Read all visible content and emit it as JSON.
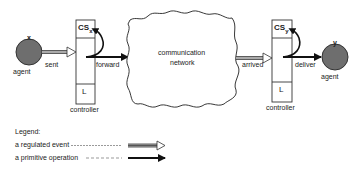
{
  "diagram": {
    "agent_left": {
      "name": "x",
      "label": "agent"
    },
    "agent_right": {
      "name": "y",
      "label": "agent"
    },
    "controller_left": {
      "top_label": "CS",
      "top_sub": "x",
      "bottom_label": "L",
      "caption": "controller"
    },
    "controller_right": {
      "top_label": "CS",
      "top_sub": "y",
      "bottom_label": "L",
      "caption": "controller"
    },
    "network": {
      "line1": "communication",
      "line2": "network"
    },
    "edges": {
      "sent": "sent",
      "forward": "forward",
      "arrived": "arrived",
      "deliver": "deliver"
    },
    "colors": {
      "agent_fill": "#6e6e6e",
      "stroke": "#222222"
    }
  },
  "legend": {
    "title": "Legend:",
    "items": [
      {
        "label": "a regulated event",
        "arrow": "hollow-double-arrow"
      },
      {
        "label": "a  primitive operation",
        "arrow": "solid-arrow"
      }
    ]
  }
}
